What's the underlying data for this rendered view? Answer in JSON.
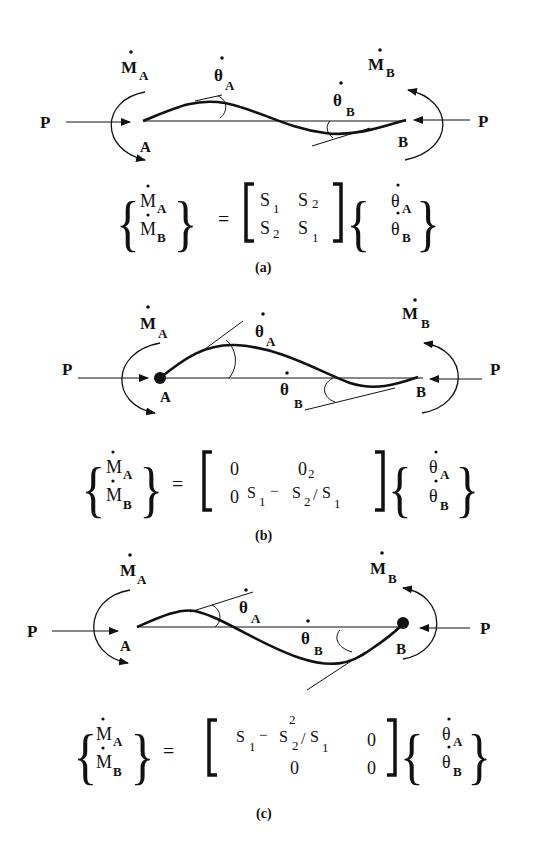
{
  "figure": {
    "panels": [
      {
        "id": "a",
        "caption": "(a)",
        "labels": {
          "P_left": "P",
          "P_right": "P",
          "A": "A",
          "B": "B",
          "MA": "M",
          "MA_sub": "A",
          "MB": "M",
          "MB_sub": "B",
          "thetaA": "θ",
          "thetaA_sub": "A",
          "thetaB": "θ",
          "thetaB_sub": "B"
        },
        "equation": {
          "lhs": [
            [
              "M",
              "A"
            ],
            [
              "M",
              "B"
            ]
          ],
          "matrix": [
            [
              "S1",
              "S2"
            ],
            [
              "S2",
              "S1"
            ]
          ],
          "rhs": [
            [
              "θ",
              "A"
            ],
            [
              "θ",
              "B"
            ]
          ]
        }
      },
      {
        "id": "b",
        "caption": "(b)",
        "labels": {
          "P_left": "P",
          "P_right": "P",
          "A": "A",
          "B": "B",
          "MA": "M",
          "MA_sub": "A",
          "MB": "M",
          "MB_sub": "B",
          "thetaA": "θ",
          "thetaA_sub": "A",
          "thetaB": "θ",
          "thetaB_sub": "B"
        },
        "equation": {
          "lhs": [
            [
              "M",
              "A"
            ],
            [
              "M",
              "B"
            ]
          ],
          "matrix": [
            [
              "0",
              "0"
            ],
            [
              "0",
              "S1 − S2²/S1"
            ]
          ],
          "rhs": [
            [
              "θ",
              "A"
            ],
            [
              "θ",
              "B"
            ]
          ]
        }
      },
      {
        "id": "c",
        "caption": "(c)",
        "labels": {
          "P_left": "P",
          "P_right": "P",
          "A": "A",
          "B": "B",
          "MA": "M",
          "MA_sub": "A",
          "MB": "M",
          "MB_sub": "B",
          "thetaA": "θ",
          "thetaA_sub": "A",
          "thetaB": "θ",
          "thetaB_sub": "B"
        },
        "equation": {
          "lhs": [
            [
              "M",
              "A"
            ],
            [
              "M",
              "B"
            ]
          ],
          "matrix": [
            [
              "S1 − S2²/S1",
              "0"
            ],
            [
              "0",
              "0"
            ]
          ],
          "rhs": [
            [
              "θ",
              "A"
            ],
            [
              "θ",
              "B"
            ]
          ]
        }
      }
    ],
    "eq_sign": "=",
    "sym": {
      "S": "S",
      "one": "1",
      "two": "2",
      "zero": "0",
      "minus": "−",
      "slash": "/",
      "sq": "2"
    }
  }
}
